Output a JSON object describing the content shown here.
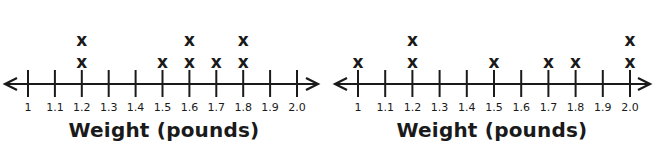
{
  "chart_data": [
    {
      "type": "line_plot",
      "title": "",
      "xlabel": "Weight (pounds)",
      "ylabel": "",
      "tick_labels": [
        "1",
        "1.1",
        "1.2",
        "1.3",
        "1.4",
        "1.5",
        "1.6",
        "1.7",
        "1.8",
        "1.9",
        "2.0"
      ],
      "x": [
        1.0,
        1.1,
        1.2,
        1.3,
        1.4,
        1.5,
        1.6,
        1.7,
        1.8,
        1.9,
        2.0
      ],
      "values": [
        0,
        0,
        2,
        0,
        0,
        1,
        2,
        1,
        2,
        0,
        0
      ],
      "marker": "x",
      "xlim": [
        1.0,
        2.0
      ],
      "grid": false
    },
    {
      "type": "line_plot",
      "title": "",
      "xlabel": "Weight (pounds)",
      "ylabel": "",
      "tick_labels": [
        "1",
        "1.1",
        "1.2",
        "1.3",
        "1.4",
        "1.5",
        "1.6",
        "1.7",
        "1.8",
        "1.9",
        "2.0"
      ],
      "x": [
        1.0,
        1.1,
        1.2,
        1.3,
        1.4,
        1.5,
        1.6,
        1.7,
        1.8,
        1.9,
        2.0
      ],
      "values": [
        1,
        0,
        2,
        0,
        0,
        1,
        0,
        1,
        1,
        0,
        2
      ],
      "marker": "x",
      "xlim": [
        1.0,
        2.0
      ],
      "grid": false
    }
  ],
  "plots": [
    {
      "xlabel": "Weight (pounds)",
      "marker_glyph": "x"
    },
    {
      "xlabel": "Weight (pounds)",
      "marker_glyph": "x"
    }
  ],
  "colors": {
    "ink": "#1a1a1a",
    "background": "#ffffff"
  }
}
